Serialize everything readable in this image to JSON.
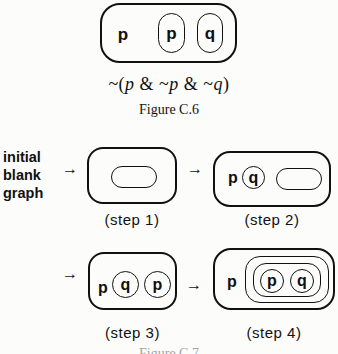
{
  "ink_color": "#111111",
  "figure_c6": {
    "sheet_label": "p",
    "cut1_label": "p",
    "cut2_label": "q",
    "formula_parts": [
      "~(",
      "p",
      " & ~",
      "p",
      " & ~",
      "q",
      ")"
    ],
    "caption": "Figure C.6"
  },
  "figure_c7": {
    "initial_label": "initial\nblank\ngraph",
    "arrow_glyph": "→",
    "step1": {
      "caption": "(step 1)"
    },
    "step2": {
      "caption": "(step 2)",
      "p_label": "p",
      "q_label": "q"
    },
    "step3": {
      "caption": "(step 3)",
      "p_label": "p",
      "q_label": "q",
      "p2_label": "p"
    },
    "step4": {
      "caption": "(step 4)",
      "p_label": "p",
      "inner_p_label": "p",
      "inner_q_label": "q"
    },
    "caption": "Figure C.7"
  }
}
